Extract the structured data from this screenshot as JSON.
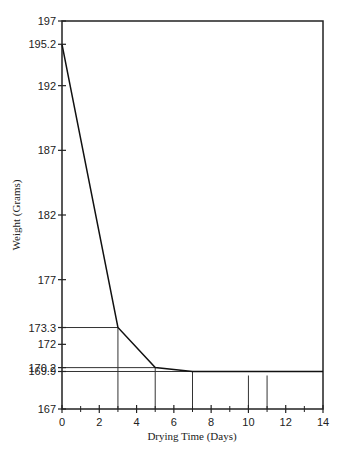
{
  "chart_data": {
    "type": "line",
    "title": "",
    "xlabel": "Drying Time (Days)",
    "ylabel": "Weight (Grams)",
    "xlim": [
      0,
      14
    ],
    "ylim": [
      167,
      197
    ],
    "x_ticks": [
      0,
      2,
      4,
      6,
      8,
      10,
      12,
      14
    ],
    "x_minor_ticks": [
      1,
      3,
      5,
      7,
      9,
      11,
      13
    ],
    "y_ticks": [
      167,
      169.9,
      170.2,
      172,
      173.3,
      177,
      182,
      187,
      192,
      195.2,
      197
    ],
    "y_tick_labels": [
      "167",
      "169.9",
      "170.2",
      "172",
      "173.3",
      "177",
      "182",
      "187",
      "192",
      "195.2",
      "197"
    ],
    "grid": false,
    "legend": null,
    "series": [
      {
        "name": "Weight",
        "x": [
          0,
          3,
          5,
          7,
          10,
          11,
          14
        ],
        "y": [
          195.2,
          173.3,
          170.2,
          169.9,
          169.9,
          169.9,
          169.9
        ]
      }
    ],
    "reference_lines": {
      "horizontal": [
        173.3,
        170.2,
        169.9
      ],
      "vertical": [
        3,
        5,
        7,
        10,
        11
      ]
    },
    "frame": "box"
  }
}
